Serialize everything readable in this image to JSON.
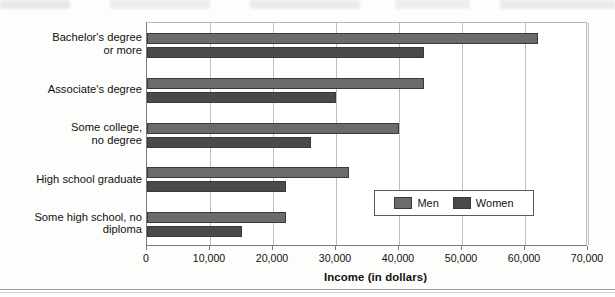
{
  "chart_data": {
    "type": "bar",
    "orientation": "horizontal",
    "title": "",
    "xlabel": "Income (in dollars)",
    "ylabel": "",
    "xlim": [
      0,
      70000
    ],
    "xticks": [
      0,
      10000,
      20000,
      30000,
      40000,
      50000,
      60000,
      70000
    ],
    "xtick_labels": [
      "0",
      "10,000",
      "20,000",
      "30,000",
      "40,000",
      "50,000",
      "60,000",
      "70,000"
    ],
    "grid": true,
    "grid_axis": "x",
    "legend_position": "lower-right-inside",
    "categories": [
      "Bachelor's degree\nor more",
      "Associate's degree",
      "Some college,\nno degree",
      "High school graduate",
      "Some high school, no diploma"
    ],
    "series": [
      {
        "name": "Men",
        "color": "#6b6b6b",
        "values": [
          62000,
          44000,
          40000,
          32000,
          22000
        ]
      },
      {
        "name": "Women",
        "color": "#4a4a4a",
        "values": [
          44000,
          30000,
          26000,
          22000,
          15000
        ]
      }
    ]
  },
  "legend": {
    "entries": [
      {
        "label": "Men",
        "color": "#6b6b6b"
      },
      {
        "label": "Women",
        "color": "#4a4a4a"
      }
    ]
  },
  "axis": {
    "x_title": "Income (in dollars)"
  }
}
